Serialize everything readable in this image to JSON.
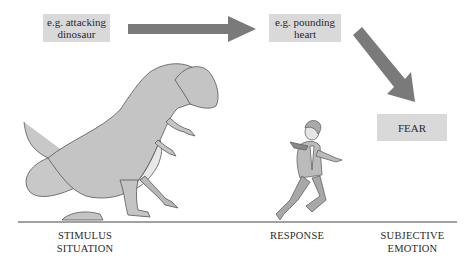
{
  "diagram": {
    "type": "flow",
    "nodes": [
      {
        "id": "stimulus_example",
        "lines": [
          "e.g. attacking",
          "dinosaur"
        ]
      },
      {
        "id": "response_example",
        "lines": [
          "e.g. pounding",
          "heart"
        ]
      },
      {
        "id": "emotion",
        "lines": [
          "FEAR"
        ]
      }
    ],
    "edges": [
      {
        "from": "stimulus_example",
        "to": "response_example"
      },
      {
        "from": "response_example",
        "to": "emotion"
      }
    ],
    "stages": [
      {
        "lines": [
          "STIMULUS",
          "SITUATION"
        ]
      },
      {
        "lines": [
          "RESPONSE"
        ]
      },
      {
        "lines": [
          "SUBJECTIVE",
          "EMOTION"
        ]
      }
    ],
    "illustrations": [
      {
        "name": "dinosaur"
      },
      {
        "name": "running-man"
      }
    ]
  },
  "colors": {
    "box_fill": "#d9d9d9",
    "arrow_fill": "#7a7a7a",
    "ground_line": "#444444"
  }
}
